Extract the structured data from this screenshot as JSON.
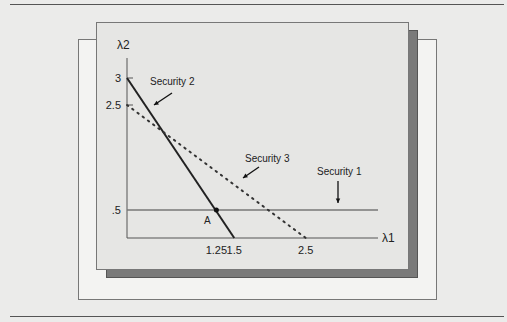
{
  "chart_data": {
    "type": "line",
    "title": "",
    "xlabel": "λ1",
    "ylabel": "λ2",
    "x_ticks": [
      {
        "value": 1.25,
        "label": "1.25"
      },
      {
        "value": 1.5,
        "label": "1.5"
      },
      {
        "value": 2.5,
        "label": "2.5"
      }
    ],
    "y_ticks": [
      {
        "value": 3,
        "label": "3"
      },
      {
        "value": 2.5,
        "label": "2.5"
      },
      {
        "value": 0.5,
        "label": ".5"
      }
    ],
    "xlim": [
      0,
      3.5
    ],
    "ylim": [
      0,
      3.5
    ],
    "grid": false,
    "series": [
      {
        "name": "Security 1",
        "style": "solid",
        "color": "#777777",
        "points": [
          [
            0,
            0.5
          ],
          [
            3.5,
            0.5
          ]
        ]
      },
      {
        "name": "Security 2",
        "style": "solid",
        "color": "#222222",
        "points": [
          [
            0,
            3
          ],
          [
            1.5,
            0
          ]
        ]
      },
      {
        "name": "Security 3",
        "style": "dotted",
        "color": "#333333",
        "points": [
          [
            0,
            2.5
          ],
          [
            2.5,
            0
          ]
        ]
      }
    ],
    "annotations": [
      {
        "text": "Security 2",
        "target": "Security 2"
      },
      {
        "text": "Security 3",
        "target": "Security 3"
      },
      {
        "text": "Security 1",
        "target": "Security 1"
      },
      {
        "text": "A",
        "point": [
          1.25,
          0.5
        ]
      }
    ]
  }
}
